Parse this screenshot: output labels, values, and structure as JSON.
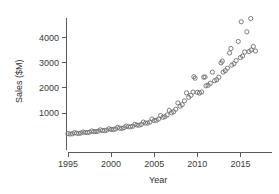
{
  "chart_data": {
    "type": "scatter",
    "title": "",
    "xlabel": "Year",
    "ylabel": "Sales ($M)",
    "xlim": [
      1994.6,
      2016.9
    ],
    "ylim": [
      0,
      4900
    ],
    "grid": false,
    "legend": null,
    "marker": "open-circle",
    "marker_color": "#6e6e6e",
    "xticks": [
      1995,
      2000,
      2005,
      2010,
      2015
    ],
    "xtick_labels": [
      "1995",
      "2000",
      "2005",
      "2010",
      "2015"
    ],
    "yticks": [
      1000,
      2000,
      3000,
      4000
    ],
    "ytick_labels": [
      "1000",
      "2000",
      "3000",
      "4000"
    ],
    "series": [
      {
        "name": "Quarterly Sales",
        "points": [
          [
            1995.0,
            180
          ],
          [
            1995.25,
            165
          ],
          [
            1995.5,
            175
          ],
          [
            1995.75,
            215
          ],
          [
            1996.0,
            200
          ],
          [
            1996.25,
            190
          ],
          [
            1996.5,
            205
          ],
          [
            1996.75,
            245
          ],
          [
            1997.0,
            230
          ],
          [
            1997.25,
            225
          ],
          [
            1997.5,
            240
          ],
          [
            1997.75,
            285
          ],
          [
            1998.0,
            265
          ],
          [
            1998.25,
            260
          ],
          [
            1998.5,
            280
          ],
          [
            1998.75,
            330
          ],
          [
            1999.0,
            305
          ],
          [
            1999.25,
            300
          ],
          [
            1999.5,
            320
          ],
          [
            1999.75,
            375
          ],
          [
            2000.0,
            350
          ],
          [
            2000.25,
            345
          ],
          [
            2000.5,
            365
          ],
          [
            2000.75,
            425
          ],
          [
            2001.0,
            400
          ],
          [
            2001.25,
            390
          ],
          [
            2001.5,
            415
          ],
          [
            2001.75,
            480
          ],
          [
            2002.0,
            455
          ],
          [
            2002.25,
            450
          ],
          [
            2002.5,
            475
          ],
          [
            2002.75,
            550
          ],
          [
            2003.0,
            520
          ],
          [
            2003.25,
            515
          ],
          [
            2003.5,
            545
          ],
          [
            2003.75,
            640
          ],
          [
            2004.0,
            600
          ],
          [
            2004.25,
            600
          ],
          [
            2004.5,
            640
          ],
          [
            2004.75,
            760
          ],
          [
            2005.0,
            700
          ],
          [
            2005.25,
            710
          ],
          [
            2005.5,
            760
          ],
          [
            2005.75,
            900
          ],
          [
            2006.0,
            830
          ],
          [
            2006.25,
            850
          ],
          [
            2006.5,
            920
          ],
          [
            2006.75,
            1100
          ],
          [
            2007.0,
            1010
          ],
          [
            2007.25,
            1050
          ],
          [
            2007.5,
            1150
          ],
          [
            2007.75,
            1400
          ],
          [
            2008.0,
            1270
          ],
          [
            2008.25,
            1330
          ],
          [
            2008.5,
            1480
          ],
          [
            2008.75,
            1800
          ],
          [
            2009.0,
            1620
          ],
          [
            2009.25,
            1700
          ],
          [
            2009.5,
            1830
          ],
          [
            2009.75,
            2380
          ],
          [
            2010.0,
            1820
          ],
          [
            2010.25,
            1790
          ],
          [
            2010.5,
            1830
          ],
          [
            2010.75,
            2420
          ],
          [
            2011.0,
            2080
          ],
          [
            2011.25,
            2100
          ],
          [
            2011.5,
            2180
          ],
          [
            2011.75,
            2620
          ],
          [
            2012.0,
            2280
          ],
          [
            2012.25,
            2320
          ],
          [
            2012.5,
            2420
          ],
          [
            2012.75,
            2990
          ],
          [
            2013.0,
            2620
          ],
          [
            2013.25,
            2680
          ],
          [
            2013.5,
            2780
          ],
          [
            2013.75,
            3380
          ],
          [
            2014.0,
            2900
          ],
          [
            2014.25,
            2960
          ],
          [
            2014.5,
            3080
          ],
          [
            2014.75,
            3840
          ],
          [
            2015.0,
            3200
          ],
          [
            2015.25,
            3260
          ],
          [
            2015.5,
            3420
          ],
          [
            2015.75,
            4220
          ],
          [
            2016.0,
            3440
          ],
          [
            2016.25,
            3500
          ],
          [
            2016.5,
            3640
          ],
          [
            2016.75,
            3460
          ],
          [
            2015.1,
            4620
          ],
          [
            2016.2,
            4750
          ],
          [
            2009.6,
            2440
          ],
          [
            2010.9,
            2430
          ],
          [
            2013.9,
            3560
          ],
          [
            2012.9,
            3060
          ]
        ]
      }
    ]
  }
}
